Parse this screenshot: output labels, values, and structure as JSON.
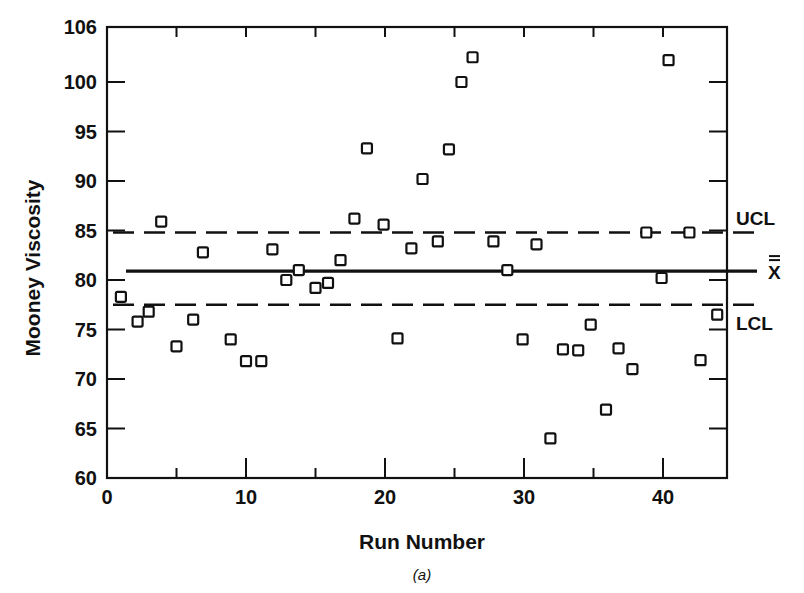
{
  "chart_data": {
    "type": "scatter",
    "title": "",
    "caption": "(a)",
    "xlabel": "Run Number",
    "ylabel": "Mooney Viscosity",
    "xlim": [
      0,
      44.5
    ],
    "ylim": [
      60,
      106
    ],
    "x_ticks_major": [
      0,
      10,
      20,
      30,
      40
    ],
    "x_ticks_minor": [
      5,
      15,
      25,
      35
    ],
    "y_ticks": [
      60,
      65,
      70,
      75,
      80,
      85,
      90,
      95,
      100,
      106
    ],
    "grid": false,
    "marker": "open-square",
    "series": [
      {
        "name": "Mooney Viscosity",
        "x": [
          1,
          2.2,
          3,
          3.9,
          5,
          6.2,
          6.9,
          8.9,
          10,
          11.1,
          11.9,
          12.9,
          13.8,
          15,
          15.9,
          16.8,
          17.8,
          18.7,
          19.9,
          20.9,
          21.9,
          22.7,
          23.8,
          24.6,
          25.5,
          26.3,
          27.8,
          28.8,
          29.9,
          30.9,
          31.9,
          32.8,
          33.9,
          34.8,
          35.9,
          36.8,
          37.8,
          38.8,
          39.9,
          40.4,
          41.9,
          42.7,
          43.9
        ],
        "values": [
          78.3,
          75.8,
          76.8,
          85.9,
          73.3,
          76.0,
          82.8,
          74.0,
          71.8,
          71.8,
          83.1,
          80.0,
          81.0,
          79.2,
          79.7,
          82.0,
          86.2,
          93.3,
          85.6,
          74.1,
          83.2,
          90.2,
          83.9,
          93.2,
          100.0,
          102.5,
          83.9,
          81.0,
          74.0,
          83.6,
          64.0,
          73.0,
          72.9,
          75.5,
          66.9,
          73.1,
          71.0,
          84.8,
          80.2,
          102.2,
          84.8,
          71.9,
          76.5
        ]
      }
    ],
    "reference_lines": [
      {
        "name": "UCL",
        "label": "UCL",
        "value": 84.8,
        "style": "dashed"
      },
      {
        "name": "X-double-bar",
        "label": "X̿",
        "value": 80.9,
        "style": "solid"
      },
      {
        "name": "LCL",
        "label": "LCL",
        "value": 77.5,
        "style": "dashed"
      }
    ]
  }
}
